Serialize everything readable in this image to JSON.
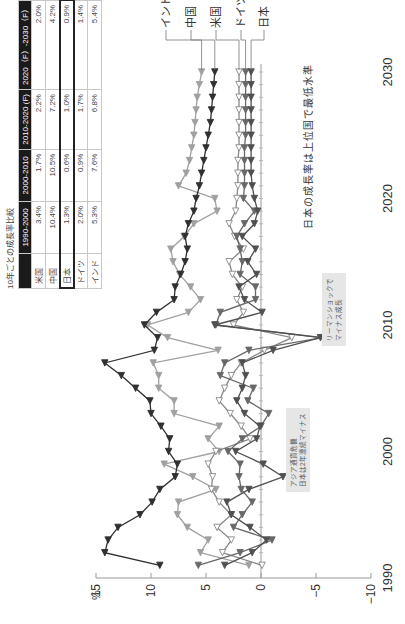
{
  "table": {
    "title": "10年ごとの成長率比較",
    "headers": [
      "",
      "1990-2000",
      "2000-2010",
      "2010-2020 (F)",
      "2020（F）-2030（F）"
    ],
    "rows": [
      {
        "country": "米国",
        "values": [
          "3.4%",
          "1.7%",
          "2.2%",
          "2.0%"
        ]
      },
      {
        "country": "中国",
        "values": [
          "10.4%",
          "10.5%",
          "7.2%",
          "4.2%"
        ]
      },
      {
        "country": "日本",
        "values": [
          "1.3%",
          "0.6%",
          "1.0%",
          "0.9%"
        ],
        "highlighted": true
      },
      {
        "country": "ドイツ",
        "values": [
          "2.0%",
          "0.9%",
          "1.7%",
          "1.4%"
        ]
      },
      {
        "country": "インド",
        "values": [
          "5.3%",
          "7.6%",
          "6.8%",
          "5.4%"
        ]
      }
    ]
  },
  "callouts": {
    "asia": [
      "アジア通貨危機",
      "日本は2年連続マイナス"
    ],
    "lehman": [
      "リーマンショックで",
      "マイナス成長"
    ]
  },
  "note": "日本の成長率は上位国で最低水準",
  "chart_data": {
    "type": "line",
    "title": "",
    "xlabel": "",
    "ylabel": "%",
    "xlim": [
      1990,
      2030
    ],
    "ylim": [
      -10,
      15
    ],
    "x_ticks": [
      1990,
      2000,
      2010,
      2020,
      2030
    ],
    "y_ticks": [
      15,
      10,
      5,
      0,
      -5,
      -10
    ],
    "legend_position": "right-end labels",
    "x": [
      1991,
      1992,
      1993,
      1994,
      1995,
      1996,
      1997,
      1998,
      1999,
      2000,
      2001,
      2002,
      2003,
      2004,
      2005,
      2006,
      2007,
      2008,
      2009,
      2010,
      2011,
      2012,
      2013,
      2014,
      2015,
      2016,
      2017,
      2018,
      2019,
      2020,
      2021,
      2022,
      2023,
      2024,
      2025,
      2026,
      2027,
      2028,
      2029,
      2030
    ],
    "series": [
      {
        "name": "インド",
        "color": "#a0a0a0",
        "marker": "filled-triangle",
        "values": [
          1.1,
          5.5,
          4.8,
          6.7,
          7.6,
          7.5,
          4.1,
          6.2,
          8.8,
          3.8,
          4.8,
          3.8,
          7.9,
          7.9,
          9.3,
          9.3,
          9.8,
          3.9,
          8.5,
          10.3,
          6.6,
          5.5,
          6.4,
          7.4,
          8.0,
          8.2,
          7.0,
          6.1,
          4.0,
          4.2,
          7.5,
          6.8,
          6.5,
          6.3,
          6.1,
          6.0,
          5.9,
          5.8,
          5.6,
          5.4
        ]
      },
      {
        "name": "中国",
        "color": "#303030",
        "marker": "filled-triangle",
        "values": [
          9.2,
          14.2,
          13.9,
          13.0,
          11.0,
          9.9,
          9.2,
          7.8,
          7.6,
          8.4,
          8.3,
          9.1,
          10.0,
          10.1,
          11.4,
          12.7,
          14.2,
          9.7,
          9.4,
          10.6,
          9.5,
          7.9,
          7.8,
          7.3,
          6.9,
          6.7,
          6.9,
          6.6,
          6.1,
          5.9,
          5.6,
          5.4,
          5.2,
          5.0,
          4.8,
          4.6,
          4.5,
          4.4,
          4.3,
          4.2
        ]
      },
      {
        "name": "米国",
        "color": "#888888",
        "marker": "open-triangle",
        "values": [
          -0.1,
          3.5,
          2.7,
          4.0,
          2.7,
          3.8,
          4.5,
          4.4,
          4.8,
          4.1,
          1.0,
          1.8,
          2.8,
          3.8,
          3.3,
          2.7,
          1.8,
          -0.3,
          -2.8,
          2.5,
          1.6,
          2.2,
          1.7,
          2.6,
          2.9,
          1.6,
          2.4,
          2.9,
          2.3,
          2.2,
          2.1,
          2.1,
          2.1,
          2.0,
          2.0,
          2.0,
          2.0,
          2.0,
          2.0,
          2.0
        ]
      },
      {
        "name": "ドイツ",
        "color": "#686868",
        "marker": "filled-triangle",
        "values": [
          5.7,
          1.9,
          -1.0,
          2.5,
          1.7,
          0.8,
          1.8,
          2.0,
          1.9,
          3.0,
          1.7,
          0.0,
          -0.7,
          1.2,
          0.7,
          3.7,
          3.3,
          1.1,
          -5.6,
          4.1,
          3.7,
          0.5,
          0.5,
          1.9,
          1.7,
          1.9,
          2.2,
          1.5,
          0.6,
          1.6,
          1.5,
          1.5,
          1.5,
          1.5,
          1.4,
          1.4,
          1.4,
          1.4,
          1.4,
          1.4
        ]
      },
      {
        "name": "日本",
        "color": "#505050",
        "marker": "filled-triangle",
        "values": [
          3.3,
          0.8,
          -0.5,
          1.0,
          2.7,
          3.1,
          1.1,
          -2.0,
          -0.2,
          2.3,
          0.4,
          0.1,
          1.5,
          2.2,
          1.7,
          1.4,
          1.7,
          -1.1,
          -5.4,
          4.2,
          -0.1,
          1.5,
          2.0,
          0.4,
          1.2,
          0.5,
          1.7,
          0.6,
          0.3,
          0.6,
          0.8,
          0.9,
          0.9,
          0.9,
          0.9,
          0.9,
          0.9,
          0.9,
          0.9,
          0.9
        ]
      }
    ],
    "annotations": [
      "アジア通貨危機 日本は2年連続マイナス",
      "リーマンショックで マイナス成長",
      "日本の成長率は上位国で最低水準"
    ]
  }
}
